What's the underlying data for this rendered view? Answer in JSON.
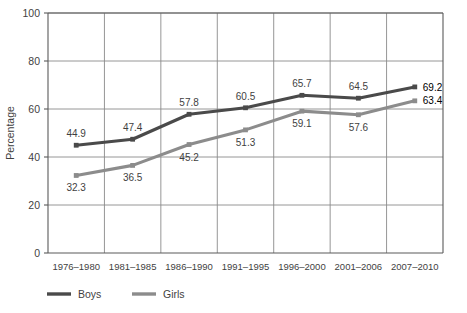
{
  "chart_data": {
    "type": "line",
    "title": "",
    "xlabel": "",
    "ylabel": "Percentage",
    "ylim": [
      0,
      100
    ],
    "yticks": [
      0,
      20,
      40,
      60,
      80,
      100
    ],
    "grid": true,
    "legend_position": "bottom",
    "categories": [
      "1976–1980",
      "1981–1985",
      "1986–1990",
      "1991–1995",
      "1996–2000",
      "2001–2006",
      "2007–2010"
    ],
    "series": [
      {
        "name": "Boys",
        "color": "#4a4a4a",
        "values": [
          44.9,
          47.4,
          57.8,
          60.5,
          65.7,
          64.5,
          69.2
        ],
        "labels": [
          "44.9",
          "47.4",
          "57.8",
          "60.5",
          "65.7",
          "64.5",
          "69.2"
        ]
      },
      {
        "name": "Girls",
        "color": "#8c8c8c",
        "values": [
          32.3,
          36.5,
          45.2,
          51.3,
          59.1,
          57.6,
          63.4
        ],
        "labels": [
          "32.3",
          "36.5",
          "45.2",
          "51.3",
          "59.1",
          "57.6",
          "63.4"
        ]
      }
    ]
  },
  "legend": {
    "items": [
      {
        "label": "Boys",
        "color": "#4a4a4a"
      },
      {
        "label": "Girls",
        "color": "#8c8c8c"
      }
    ]
  },
  "colors": {
    "boys": "#4a4a4a",
    "girls": "#8c8c8c",
    "grid": "#8a8a8a",
    "axis": "#5a5a5a",
    "text": "#3f3f3f",
    "background": "#ffffff"
  }
}
